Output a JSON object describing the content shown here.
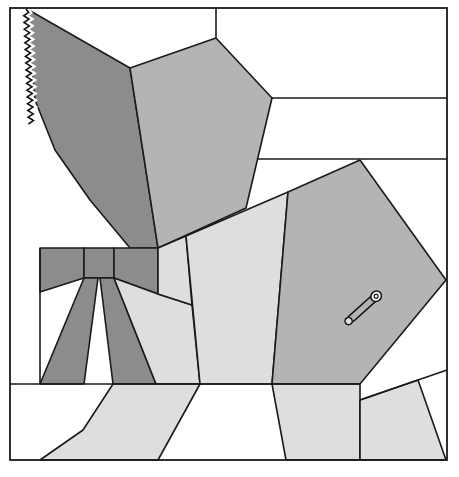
{
  "diagram": {
    "title": "",
    "type": "quilt-block-pattern",
    "colors": {
      "background": "#ffffff",
      "dark": "#8c8c8c",
      "medium": "#b4b4b4",
      "light": "#dedede",
      "line": "#1a1a1a"
    },
    "pieces": [
      {
        "name": "bonnet-brim",
        "shade": "dark",
        "points": "27,9 130,68 158,248 130,248 90,200 55,150 35,100 30,50"
      },
      {
        "name": "bonnet-crown",
        "shade": "medium",
        "points": "130,68 216,38 272,98 246,208 158,248"
      },
      {
        "name": "bow-left-wing",
        "shade": "dark",
        "points": "40,248 84,248 84,278 40,292"
      },
      {
        "name": "bow-knot",
        "shade": "dark",
        "points": "84,248 114,248 114,278 84,278"
      },
      {
        "name": "bow-right-wing",
        "shade": "dark",
        "points": "114,248 158,248 158,294 114,278"
      },
      {
        "name": "ribbon-left",
        "shade": "dark",
        "points": "84,278 98,278 84,384 40,384"
      },
      {
        "name": "ribbon-right",
        "shade": "dark",
        "points": "100,278 114,278 156,384 113,384"
      },
      {
        "name": "dress-skirt-left",
        "shade": "light",
        "points": "114,278 158,294 192,305 200,384 156,384"
      },
      {
        "name": "collar-strip",
        "shade": "light",
        "points": "158,248 186,236 192,305 158,294"
      },
      {
        "name": "dress-front",
        "shade": "light",
        "points": "186,236 288,192 272,384 200,384"
      },
      {
        "name": "sleeve",
        "shade": "medium",
        "points": "288,192 360,160 446,280 360,384 272,384"
      },
      {
        "name": "shoe-left",
        "shade": "light",
        "points": "113,384 200,384 158,460 40,460 83,430"
      },
      {
        "name": "leg-right",
        "shade": "light",
        "points": "272,384 360,384 360,460 286,460"
      },
      {
        "name": "hand",
        "shade": "light",
        "points": "360,400 418,380 446,460 360,460"
      }
    ],
    "lines": [
      {
        "name": "sky-line-top",
        "x1": 216,
        "y1": 8,
        "x2": 216,
        "y2": 38
      },
      {
        "name": "sky-line-1",
        "x1": 272,
        "y1": 98,
        "x2": 447,
        "y2": 98
      },
      {
        "name": "sky-line-2",
        "x1": 258,
        "y1": 159,
        "x2": 447,
        "y2": 159
      },
      {
        "name": "left-column-line",
        "x1": 40,
        "y1": 248,
        "x2": 40,
        "y2": 384
      },
      {
        "name": "ground-line",
        "x1": 10,
        "y1": 384,
        "x2": 360,
        "y2": 384
      },
      {
        "name": "hand-top-line",
        "x1": 360,
        "y1": 400,
        "x2": 447,
        "y2": 370
      }
    ],
    "frame": {
      "x": 10,
      "y": 8,
      "width": 437,
      "height": 452
    },
    "annotations": {
      "zigzag": "rickrack trim along bonnet edge",
      "pin": "safety pin on sleeve"
    }
  }
}
